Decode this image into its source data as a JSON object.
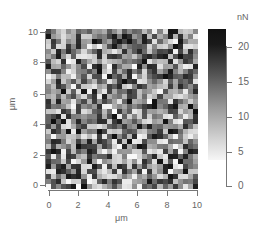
{
  "chart_data": {
    "type": "heatmap",
    "title": "",
    "xlabel": "μm",
    "ylabel": "μm",
    "xlim": [
      0,
      10
    ],
    "ylim": [
      0,
      10
    ],
    "x_ticks": [
      "0",
      "2",
      "4",
      "6",
      "8",
      "10"
    ],
    "y_ticks": [
      "0",
      "2",
      "4",
      "6",
      "8",
      "10"
    ],
    "grid": false,
    "grid_size": {
      "columns": 30,
      "rows": 32
    },
    "value_range": [
      0,
      22
    ],
    "colormap": {
      "low": "#ffffff",
      "high": "#111111"
    },
    "colorbar": {
      "label": "nN",
      "ticks": [
        "0",
        "5",
        "10",
        "15",
        "20"
      ],
      "range": [
        0,
        22
      ]
    },
    "seed": 1337,
    "note": "Random-looking pixel map of force values (nN) across a 10×10 μm scan"
  },
  "axes": {
    "x_label": "μm",
    "y_label": "μm",
    "x_ticks": [
      "0",
      "2",
      "4",
      "6",
      "8",
      "10"
    ],
    "y_ticks": [
      "0",
      "2",
      "4",
      "6",
      "8",
      "10"
    ]
  },
  "colorbar": {
    "unit": "nN",
    "ticks": [
      "0",
      "5",
      "10",
      "15",
      "20"
    ]
  }
}
